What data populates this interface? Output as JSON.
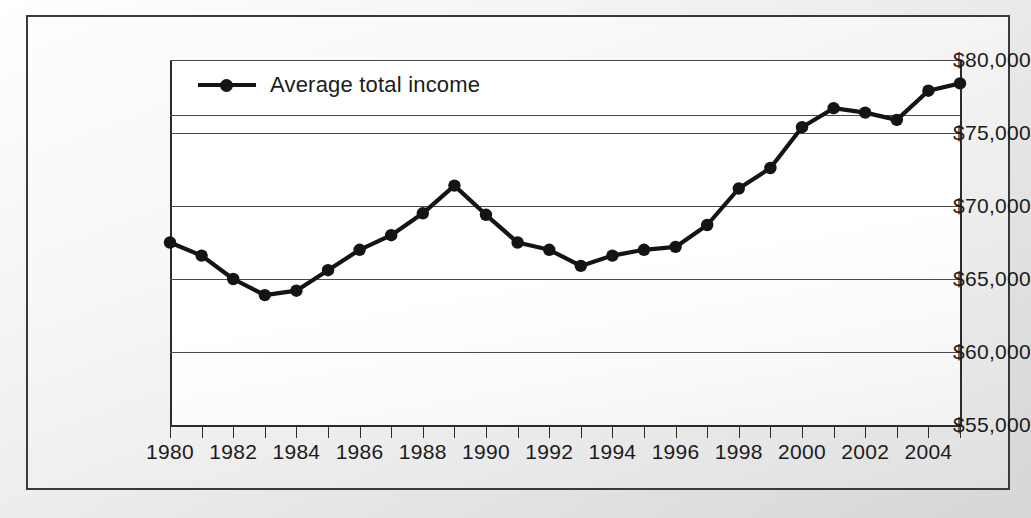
{
  "chart_data": {
    "type": "line",
    "title": "",
    "subtitle": "",
    "xlabel": "",
    "ylabel": "",
    "grid": true,
    "legend_position": "top-left-inside",
    "xlim": [
      1980,
      2005
    ],
    "ylim": [
      55000,
      80000
    ],
    "ytick_labels": [
      "$80,000",
      "$75,000",
      "$70,000",
      "$65,000",
      "$60,000",
      "$55,000"
    ],
    "ytick_values": [
      80000,
      75000,
      70000,
      65000,
      60000,
      55000
    ],
    "xtick_values": [
      1980,
      1981,
      1982,
      1983,
      1984,
      1985,
      1986,
      1987,
      1988,
      1989,
      1990,
      1991,
      1992,
      1993,
      1994,
      1995,
      1996,
      1997,
      1998,
      1999,
      2000,
      2001,
      2002,
      2003,
      2004,
      2005
    ],
    "xtick_labels_shown": [
      "1980",
      "1982",
      "1984",
      "1986",
      "1988",
      "1990",
      "1992",
      "1994",
      "1996",
      "1998",
      "2000",
      "2002",
      "2004"
    ],
    "x": [
      1980,
      1981,
      1982,
      1983,
      1984,
      1985,
      1986,
      1987,
      1988,
      1989,
      1990,
      1991,
      1992,
      1993,
      1994,
      1995,
      1996,
      1997,
      1998,
      1999,
      2000,
      2001,
      2002,
      2003,
      2004,
      2005
    ],
    "series": [
      {
        "name": "Average total income",
        "color": "#141414",
        "marker": "circle",
        "values": [
          67500,
          66600,
          65000,
          63900,
          64200,
          65600,
          67000,
          68000,
          69500,
          71400,
          69400,
          67500,
          67000,
          65900,
          66600,
          67000,
          67200,
          68700,
          71200,
          72600,
          75400,
          76700,
          76400,
          75900,
          77900,
          78400
        ]
      }
    ]
  },
  "legend": {
    "entries": [
      {
        "label": "Average total income"
      }
    ]
  },
  "axes": {
    "y_labels": [
      "$80,000",
      "$75,000",
      "$70,000",
      "$65,000",
      "$60,000",
      "$55,000"
    ],
    "x_labels": [
      "1980",
      "1982",
      "1984",
      "1986",
      "1988",
      "1990",
      "1992",
      "1994",
      "1996",
      "1998",
      "2000",
      "2002",
      "2004"
    ]
  },
  "colors": {
    "series": "#141414",
    "axis": "#2b2b2b",
    "grid": "#4a4a4a",
    "frame": "#3a3a3a",
    "text": "#1b1b1b"
  }
}
